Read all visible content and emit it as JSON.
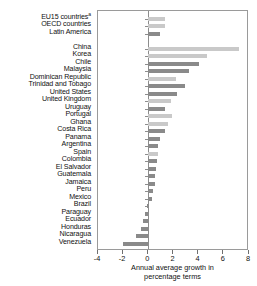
{
  "chart_data": {
    "type": "bar",
    "orientation": "horizontal",
    "title": "",
    "xlabel_line1": "Annual average growth in",
    "xlabel_line2": "percentage terms",
    "ylabel": "",
    "xlim": [
      -4,
      8
    ],
    "xticks": [
      -4,
      -2,
      0,
      2,
      4,
      6,
      8
    ],
    "xticklabels": [
      "-4",
      "-2",
      "0",
      "2",
      "4",
      "6",
      "8"
    ],
    "grid": false,
    "legend": "none",
    "zero_line": 0,
    "group_gap_after_index": 2,
    "colors": {
      "light_bar": "#c9c9c9",
      "dark_bar": "#8a8a8a",
      "frame": "#9a9a9a",
      "text": "#111111"
    },
    "categories": [
      "EU15 countries",
      "OECD countries",
      "Latin America",
      "China",
      "Korea",
      "Chile",
      "Malaysia",
      "Dominican Republic",
      "Trinidad and Tobago",
      "United States",
      "United Kingdom",
      "Uruguay",
      "Portugal",
      "Ghana",
      "Costa Rica",
      "Panama",
      "Argentina",
      "Spain",
      "Colombia",
      "El Salvador",
      "Guatemala",
      "Jamaica",
      "Peru",
      "Mexico",
      "Brazil",
      "Paraguay",
      "Ecuador",
      "Honduras",
      "Nicaragua",
      "Venezuela"
    ],
    "category_footnotes": {
      "EU15 countries": "a"
    },
    "values": [
      1.3,
      1.3,
      0.9,
      7.2,
      4.7,
      4.0,
      3.2,
      2.2,
      2.9,
      2.3,
      1.8,
      1.3,
      1.9,
      1.6,
      1.3,
      0.9,
      0.8,
      0.8,
      0.7,
      0.6,
      0.5,
      0.5,
      0.4,
      0.3,
      -0.1,
      -0.3,
      -0.4,
      -0.6,
      -1.0,
      -2.0
    ],
    "shades": [
      "light",
      "light",
      "dark",
      "light",
      "light",
      "dark",
      "dark",
      "light",
      "dark",
      "dark",
      "light",
      "dark",
      "light",
      "light",
      "dark",
      "dark",
      "dark",
      "light",
      "dark",
      "dark",
      "dark",
      "dark",
      "dark",
      "dark",
      "dark",
      "dark",
      "dark",
      "dark",
      "dark",
      "dark"
    ]
  }
}
